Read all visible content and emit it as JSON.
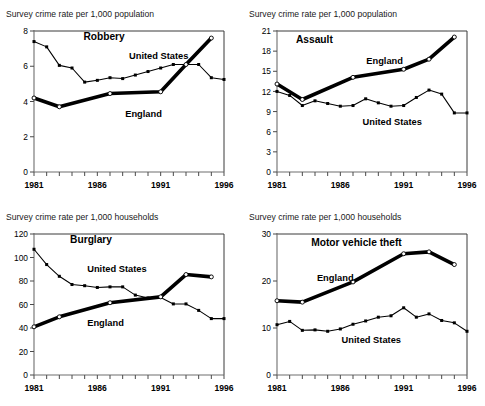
{
  "figure": {
    "name": "crime-rate-comparison-figure",
    "width": 485,
    "height": 406,
    "background": "#ffffff",
    "ink_color": "#000000"
  },
  "panels": [
    {
      "id": "robbery",
      "axis_label": "Survey crime rate per 1,000 population",
      "chart_data": {
        "type": "line",
        "title": "Robbery",
        "xlabel": "",
        "ylabel": "Survey crime rate per 1,000 population",
        "xlim": [
          1981,
          1996
        ],
        "ylim": [
          0,
          8
        ],
        "yticks": [
          0,
          2,
          4,
          6,
          8
        ],
        "ytick_labels": [
          "0",
          "2",
          "4",
          "6",
          "8"
        ],
        "xticks": [
          1981,
          1982,
          1983,
          1984,
          1985,
          1986,
          1987,
          1988,
          1989,
          1990,
          1991,
          1992,
          1993,
          1994,
          1995,
          1996
        ],
        "xtick_labels": [
          "1981",
          "",
          "",
          "",
          "",
          "1986",
          "",
          "",
          "",
          "",
          "1991",
          "",
          "",
          "",
          "",
          "1996"
        ],
        "grid": false,
        "legend": "inline-labels",
        "series": [
          {
            "name": "United States",
            "style": "thin",
            "marker": "solid-square",
            "x": [
              1981,
              1982,
              1983,
              1984,
              1985,
              1986,
              1987,
              1988,
              1989,
              1990,
              1991,
              1992,
              1993,
              1994,
              1995,
              1996
            ],
            "values": [
              7.4,
              7.1,
              6.05,
              5.9,
              5.1,
              5.2,
              5.35,
              5.3,
              5.5,
              5.7,
              5.9,
              6.1,
              6.1,
              6.1,
              5.35,
              5.25
            ]
          },
          {
            "name": "England",
            "style": "thick",
            "marker": "open-circle",
            "x": [
              1981,
              1983,
              1987,
              1991,
              1993,
              1995
            ],
            "values": [
              4.2,
              3.7,
              4.45,
              4.55,
              6.1,
              7.6
            ]
          }
        ],
        "annotations": [
          {
            "text": "Robbery",
            "kind": "panel-title"
          },
          {
            "text": "United States",
            "kind": "series-label"
          },
          {
            "text": "England",
            "kind": "series-label"
          }
        ]
      }
    },
    {
      "id": "assault",
      "axis_label": "Survey crime rate per 1,000 population",
      "chart_data": {
        "type": "line",
        "title": "Assault",
        "xlabel": "",
        "ylabel": "Survey crime rate per 1,000 population",
        "xlim": [
          1981,
          1996
        ],
        "ylim": [
          0,
          21
        ],
        "yticks": [
          0,
          3,
          6,
          9,
          12,
          15,
          18,
          21
        ],
        "ytick_labels": [
          "0",
          "3",
          "6",
          "9",
          "12",
          "15",
          "18",
          "21"
        ],
        "xticks": [
          1981,
          1982,
          1983,
          1984,
          1985,
          1986,
          1987,
          1988,
          1989,
          1990,
          1991,
          1992,
          1993,
          1994,
          1995,
          1996
        ],
        "xtick_labels": [
          "1981",
          "",
          "",
          "",
          "",
          "1986",
          "",
          "",
          "",
          "",
          "1991",
          "",
          "",
          "",
          "",
          "1996"
        ],
        "grid": false,
        "legend": "inline-labels",
        "series": [
          {
            "name": "United States",
            "style": "thin",
            "marker": "solid-square",
            "x": [
              1981,
              1982,
              1983,
              1984,
              1985,
              1986,
              1987,
              1988,
              1989,
              1990,
              1991,
              1992,
              1993,
              1994,
              1995,
              1996
            ],
            "values": [
              12.0,
              11.4,
              9.9,
              10.6,
              10.2,
              9.8,
              9.9,
              10.9,
              10.3,
              9.8,
              9.9,
              11.1,
              12.2,
              11.6,
              8.8,
              8.8
            ]
          },
          {
            "name": "England",
            "style": "thick",
            "marker": "open-circle",
            "x": [
              1981,
              1983,
              1987,
              1991,
              1993,
              1995
            ],
            "values": [
              13.1,
              10.8,
              14.1,
              15.3,
              16.8,
              20.1
            ]
          }
        ],
        "annotations": [
          {
            "text": "Assault",
            "kind": "panel-title"
          },
          {
            "text": "England",
            "kind": "series-label"
          },
          {
            "text": "United States",
            "kind": "series-label"
          }
        ]
      }
    },
    {
      "id": "burglary",
      "axis_label": "Survey crime rate per 1,000 households",
      "chart_data": {
        "type": "line",
        "title": "Burglary",
        "xlabel": "",
        "ylabel": "Survey crime rate per 1,000 households",
        "xlim": [
          1981,
          1996
        ],
        "ylim": [
          0,
          120
        ],
        "yticks": [
          0,
          20,
          40,
          60,
          80,
          100,
          120
        ],
        "ytick_labels": [
          "0",
          "20",
          "40",
          "60",
          "80",
          "100",
          "120"
        ],
        "xticks": [
          1981,
          1982,
          1983,
          1984,
          1985,
          1986,
          1987,
          1988,
          1989,
          1990,
          1991,
          1992,
          1993,
          1994,
          1995,
          1996
        ],
        "xtick_labels": [
          "1981",
          "",
          "",
          "",
          "",
          "1986",
          "",
          "",
          "",
          "",
          "1991",
          "",
          "",
          "",
          "",
          "1996"
        ],
        "grid": false,
        "legend": "inline-labels",
        "series": [
          {
            "name": "United States",
            "style": "thin",
            "marker": "solid-square",
            "x": [
              1981,
              1982,
              1983,
              1984,
              1985,
              1986,
              1987,
              1988,
              1989,
              1990,
              1991,
              1992,
              1993,
              1994,
              1995,
              1996
            ],
            "values": [
              107,
              94,
              84,
              77,
              76,
              74.5,
              75,
              75,
              68,
              65.5,
              66,
              60.5,
              60.5,
              55,
              48,
              48
            ]
          },
          {
            "name": "England",
            "style": "thick",
            "marker": "open-circle",
            "x": [
              1981,
              1983,
              1987,
              1991,
              1993,
              1995
            ],
            "values": [
              41,
              49.5,
              61.5,
              66.5,
              85.5,
              83.5
            ]
          }
        ],
        "annotations": [
          {
            "text": "Burglary",
            "kind": "panel-title"
          },
          {
            "text": "United States",
            "kind": "series-label"
          },
          {
            "text": "England",
            "kind": "series-label"
          }
        ]
      }
    },
    {
      "id": "motor-vehicle-theft",
      "axis_label": "Survey crime rate per 1,000 households",
      "chart_data": {
        "type": "line",
        "title": "Motor vehicle theft",
        "xlabel": "",
        "ylabel": "Survey crime rate per 1,000 households",
        "xlim": [
          1981,
          1996
        ],
        "ylim": [
          0,
          30
        ],
        "yticks": [
          0,
          10,
          20,
          30
        ],
        "ytick_labels": [
          "0",
          "10",
          "20",
          "30"
        ],
        "xticks": [
          1981,
          1982,
          1983,
          1984,
          1985,
          1986,
          1987,
          1988,
          1989,
          1990,
          1991,
          1992,
          1993,
          1994,
          1995,
          1996
        ],
        "xtick_labels": [
          "1981",
          "",
          "",
          "",
          "",
          "1986",
          "",
          "",
          "",
          "",
          "1991",
          "",
          "",
          "",
          "",
          "1996"
        ],
        "grid": false,
        "legend": "inline-labels",
        "series": [
          {
            "name": "United States",
            "style": "thin",
            "marker": "solid-square",
            "x": [
              1981,
              1982,
              1983,
              1984,
              1985,
              1986,
              1987,
              1988,
              1989,
              1990,
              1991,
              1992,
              1993,
              1994,
              1995,
              1996
            ],
            "values": [
              10.7,
              11.4,
              9.5,
              9.6,
              9.3,
              9.8,
              10.8,
              11.5,
              12.3,
              12.6,
              14.3,
              12.3,
              13.0,
              11.6,
              11.1,
              9.3
            ]
          },
          {
            "name": "England",
            "style": "thick",
            "marker": "open-circle",
            "x": [
              1981,
              1983,
              1987,
              1991,
              1993,
              1995
            ],
            "values": [
              15.8,
              15.5,
              19.8,
              25.8,
              26.2,
              23.5
            ]
          }
        ],
        "annotations": [
          {
            "text": "Motor vehicle theft",
            "kind": "panel-title"
          },
          {
            "text": "England",
            "kind": "series-label"
          },
          {
            "text": "United States",
            "kind": "series-label"
          }
        ]
      }
    }
  ],
  "panel_layout": {
    "robbery": {
      "title_pos": [
        0.26,
        0.06
      ],
      "labels": {
        "United States": [
          0.5,
          0.195
        ],
        "England": [
          0.48,
          0.61
        ]
      }
    },
    "assault": {
      "title_pos": [
        0.1,
        0.085
      ],
      "labels": {
        "England": [
          0.47,
          0.235
        ],
        "United States": [
          0.45,
          0.665
        ]
      }
    },
    "burglary": {
      "title_pos": [
        0.19,
        0.065
      ],
      "labels": {
        "United States": [
          0.28,
          0.27
        ],
        "England": [
          0.28,
          0.655
        ]
      }
    },
    "motor-vehicle-theft": {
      "title_pos": [
        0.18,
        0.085
      ],
      "labels": {
        "England": [
          0.21,
          0.33
        ],
        "United States": [
          0.34,
          0.77
        ]
      }
    }
  }
}
